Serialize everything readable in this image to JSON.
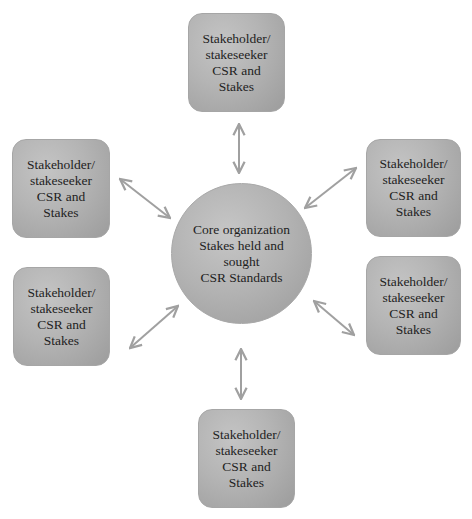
{
  "diagram": {
    "type": "hub-and-spoke",
    "colors": {
      "node_fill": "#b4b4b4",
      "node_border": "#a6a6a6",
      "arrow": "#a0a0a0",
      "text": "#1e1e1e",
      "background": "#ffffff"
    },
    "core": {
      "lines": [
        "Core organization",
        "Stakes held and",
        "sought",
        "CSR Standards"
      ]
    },
    "nodes": [
      {
        "position": "top",
        "lines": [
          "Stakeholder/",
          "stakeseeker",
          "CSR and",
          "Stakes"
        ]
      },
      {
        "position": "left-top",
        "lines": [
          "Stakeholder/",
          "stakeseeker",
          "CSR and",
          "Stakes"
        ]
      },
      {
        "position": "right-top",
        "lines": [
          "Stakeholder/",
          "stakeseeker",
          "CSR and",
          "Stakes"
        ]
      },
      {
        "position": "left-bottom",
        "lines": [
          "Stakeholder/",
          "stakeseeker",
          "CSR and",
          "Stakes"
        ]
      },
      {
        "position": "right-bottom",
        "lines": [
          "Stakeholder/",
          "stakeseeker",
          "CSR and",
          "Stakes"
        ]
      },
      {
        "position": "bottom",
        "lines": [
          "Stakeholder/",
          "stakeseeker",
          "CSR and",
          "Stakes"
        ]
      }
    ],
    "edges": [
      {
        "from": "core",
        "to": "top",
        "direction": "bidirectional"
      },
      {
        "from": "core",
        "to": "left-top",
        "direction": "bidirectional"
      },
      {
        "from": "core",
        "to": "right-top",
        "direction": "bidirectional"
      },
      {
        "from": "core",
        "to": "left-bottom",
        "direction": "bidirectional"
      },
      {
        "from": "core",
        "to": "right-bottom",
        "direction": "bidirectional"
      },
      {
        "from": "core",
        "to": "bottom",
        "direction": "bidirectional"
      }
    ]
  }
}
